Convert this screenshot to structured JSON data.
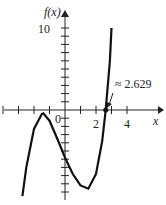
{
  "chart_data": {
    "type": "line",
    "title": "",
    "xlabel": "x",
    "ylabel": "f(x)",
    "x_ticks": [
      -4,
      -3,
      -2,
      -1,
      0,
      1,
      2,
      3,
      4
    ],
    "x_tick_labels": [
      "0",
      "2",
      "4"
    ],
    "y_tick_labels": [
      "10"
    ],
    "xlim": [
      -4.2,
      5
    ],
    "ylim": [
      -11,
      12
    ],
    "grid": false,
    "annotation": {
      "text": "≈ 2.629",
      "x": 2.629,
      "y": 0
    },
    "series": [
      {
        "name": "f(x)",
        "x": [
          -2.75,
          -2.5,
          -2,
          -1.5,
          -1.4,
          -1,
          -0.5,
          0,
          0.5,
          1,
          1.5,
          2,
          2.4,
          2.629,
          2.9,
          3.0
        ],
        "y": [
          -10.5,
          -7,
          -2.3,
          -0.5,
          -0.4,
          -1.3,
          -3.5,
          -5.8,
          -7.8,
          -9.2,
          -9.6,
          -7.8,
          -3.8,
          0,
          6,
          10
        ]
      }
    ],
    "root_marker": {
      "x": 2.629,
      "y": 0
    }
  },
  "labels": {
    "ylabel": "f(x)",
    "xlabel": "x",
    "zero": "0",
    "two": "2",
    "four": "4",
    "ten": "10",
    "annotation": "≈ 2.629"
  }
}
